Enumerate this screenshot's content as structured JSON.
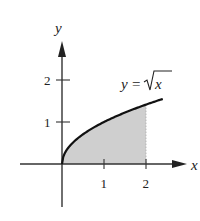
{
  "chart_data": {
    "type": "area",
    "title": "",
    "function_label": "y = √x",
    "function_label_parts": {
      "lhs": "y",
      "eq": "=",
      "radical_arg": "x"
    },
    "xlabel": "x",
    "ylabel": "y",
    "x_ticks": [
      "1",
      "2"
    ],
    "y_ticks": [
      "1",
      "2"
    ],
    "xlim": [
      -1,
      2.9
    ],
    "ylim": [
      -1,
      2.9
    ],
    "curve": {
      "expr": "sqrt(x)",
      "x_start": 0,
      "x_end": 2.4
    },
    "shaded_region": {
      "x_from": 0,
      "x_to": 2,
      "under": "y = sqrt(x)",
      "above": "x-axis"
    },
    "grid": false,
    "colors": {
      "curve": "#111111",
      "shade": "#cfcfcf",
      "axes": "#333333"
    }
  }
}
